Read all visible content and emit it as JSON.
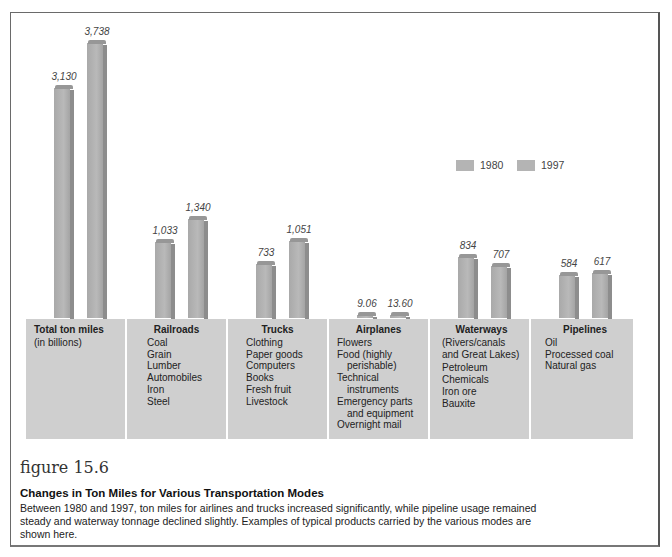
{
  "chart_data": {
    "type": "bar",
    "title": "Changes in Ton Miles for Various Transportation Modes",
    "ylabel": "Total ton miles (in billions)",
    "xlabel": "",
    "grid": false,
    "legend_position": "upper right",
    "categories": [
      "Total ton miles",
      "Railroads",
      "Trucks",
      "Airplanes",
      "Waterways",
      "Pipelines"
    ],
    "series": [
      {
        "name": "1980",
        "values": [
          3130,
          1033,
          733,
          9.06,
          834,
          584
        ]
      },
      {
        "name": "1997",
        "values": [
          3738,
          1340,
          1051,
          13.6,
          707,
          617
        ]
      }
    ],
    "value_labels": {
      "1980": [
        "3,130",
        "1,033",
        "733",
        "9.06",
        "834",
        "584"
      ],
      "1997": [
        "3,738",
        "1,340",
        "1,051",
        "13.60",
        "707",
        "617"
      ]
    }
  },
  "legend": {
    "items": [
      {
        "label": "1980"
      },
      {
        "label": "1997"
      }
    ]
  },
  "panels": [
    {
      "title": "Total ton miles",
      "items": [
        "(in billions)"
      ]
    },
    {
      "title": "Railroads",
      "items": [
        "Coal",
        "Grain",
        "Lumber",
        "Automobiles",
        "Iron",
        "Steel"
      ]
    },
    {
      "title": "Trucks",
      "items": [
        "Clothing",
        "Paper goods",
        "Computers",
        "Books",
        "Fresh fruit",
        "Livestock"
      ]
    },
    {
      "title": "Airplanes",
      "items": [
        "Flowers",
        "Food (highly",
        "perishable)",
        "Technical",
        "instruments",
        "Emergency parts",
        "and equipment",
        "Overnight mail"
      ]
    },
    {
      "title": "Waterways",
      "items": [
        "(Rivers/canals",
        "and Great Lakes)",
        "Petroleum",
        "Chemicals",
        "Iron ore",
        "Bauxite"
      ]
    },
    {
      "title": "Pipelines",
      "items": [
        "Oil",
        "Processed coal",
        "Natural gas"
      ]
    }
  ],
  "caption": {
    "figure_number": "figure 15.6",
    "title": "Changes in Ton Miles for Various Transportation Modes",
    "body": "Between 1980 and 1997, ton miles for airlines and trucks increased significantly, while pipeline usage remained steady and waterway tonnage declined slightly. Examples of typical products carried by the various modes are shown here."
  }
}
